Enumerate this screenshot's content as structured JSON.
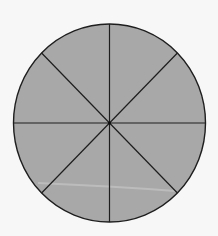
{
  "diagram": {
    "type": "circle-divided-into-equal-sectors",
    "sectors": 8,
    "shaded_sectors": 8,
    "colors": {
      "background": "#f7f7f7",
      "fill": "#a8a8a8",
      "stroke": "#1e1e1e",
      "artifact_streak": "#c4c4c4"
    },
    "geometry": {
      "center": [
        109.5,
        123
      ],
      "rx": 96,
      "ry": 99
    }
  }
}
